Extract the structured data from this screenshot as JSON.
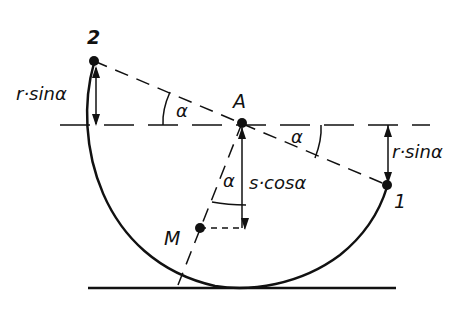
{
  "diagram": {
    "points": {
      "p2": {
        "label": "2",
        "x": 94,
        "y": 61
      },
      "A": {
        "label": "A",
        "x": 242,
        "y": 123
      },
      "p1": {
        "label": "1",
        "x": 387,
        "y": 185
      },
      "M": {
        "label": "M",
        "x": 200,
        "y": 228
      }
    },
    "labels": {
      "left_distance": "r·sinα",
      "right_distance": "r·sinα",
      "vertical_distance": "s·cosα",
      "angle_left": "α",
      "angle_right": "α",
      "angle_bottom": "α"
    },
    "colors": {
      "ink": "#111111",
      "background": "#ffffff"
    }
  }
}
